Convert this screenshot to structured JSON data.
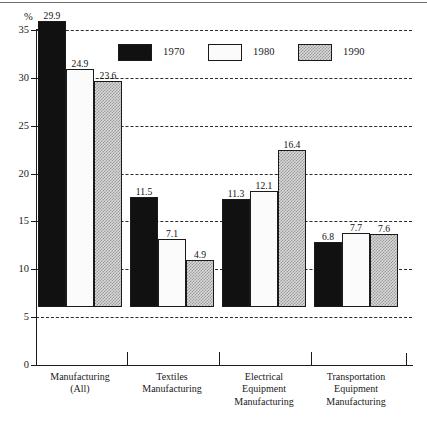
{
  "chart_data": {
    "type": "bar",
    "title": "",
    "subtitle": "",
    "xlabel": "",
    "ylabel": "%",
    "ylim": [
      0,
      35
    ],
    "yticks": [
      0,
      5,
      10,
      15,
      20,
      25,
      30,
      35
    ],
    "ytick_labels": [
      "0",
      "5",
      "10",
      "15",
      "20",
      "25",
      "30",
      "35"
    ],
    "grid": "horizontal-dashed",
    "legend_position": "top-center",
    "categories": [
      "Manufacturing\n(All)",
      "Textiles\nManufacturing",
      "Electrical\nEquipment\nManufacturing",
      "Transportation\nEquipment\nManufacturing"
    ],
    "series": [
      {
        "name": "1970",
        "fill": "solid-black",
        "color": "#111111",
        "values": [
          29.9,
          11.5,
          11.3,
          6.8
        ],
        "labels": [
          "29.9",
          "11.5",
          "11.3",
          "6.8"
        ]
      },
      {
        "name": "1980",
        "fill": "open-white",
        "color": "#fbfbfb",
        "values": [
          24.9,
          7.1,
          12.1,
          7.7
        ],
        "labels": [
          "24.9",
          "7.1",
          "12.1",
          "7.7"
        ]
      },
      {
        "name": "1990",
        "fill": "checkered-gray",
        "color": "#d8d8d8",
        "values": [
          23.6,
          4.9,
          16.4,
          7.6
        ],
        "labels": [
          "23.6",
          "4.9",
          "16.4",
          "7.6"
        ]
      }
    ]
  },
  "legend": {
    "items": [
      {
        "label": "1970"
      },
      {
        "label": "1980"
      },
      {
        "label": "1990"
      }
    ]
  },
  "axis": {
    "unit_label": "%",
    "y_tick_labels": [
      "35",
      "30",
      "25",
      "20",
      "15",
      "10",
      "5",
      "0"
    ]
  },
  "categories": [
    {
      "line1": "Manufacturing",
      "line2": "(All)",
      "line3": ""
    },
    {
      "line1": "Textiles",
      "line2": "Manufacturing",
      "line3": ""
    },
    {
      "line1": "Electrical",
      "line2": "Equipment",
      "line3": "Manufacturing"
    },
    {
      "line1": "Transportation",
      "line2": "Equipment",
      "line3": "Manufacturing"
    }
  ]
}
